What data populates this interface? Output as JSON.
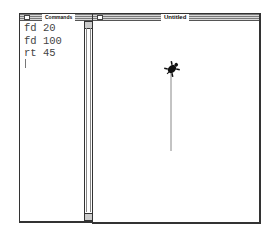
{
  "commands_window": {
    "title": "Commands",
    "lines": [
      "fd 20",
      "fd 100",
      "rt 45"
    ],
    "text": "fd 20\nfd 100\nrt 45"
  },
  "graphics_window": {
    "title": "Untitled",
    "turtle": {
      "x": 79,
      "y": 48,
      "heading_deg": 45
    },
    "trail": {
      "x1": 78,
      "y1": 52,
      "x2": 78,
      "y2": 130,
      "color": "#888888"
    }
  }
}
